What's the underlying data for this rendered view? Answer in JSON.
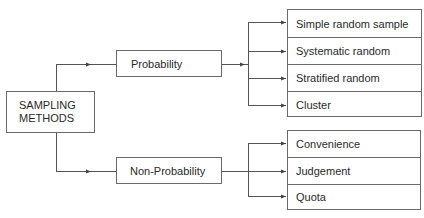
{
  "diagram": {
    "type": "tree",
    "root": {
      "label": "SAMPLING\nMETHODS"
    },
    "categories": [
      {
        "label": "Probability",
        "children": [
          {
            "label": "Simple random sample"
          },
          {
            "label": "Systematic random"
          },
          {
            "label": "Stratified random"
          },
          {
            "label": "Cluster"
          }
        ]
      },
      {
        "label": "Non-Probability",
        "children": [
          {
            "label": "Convenience"
          },
          {
            "label": "Judgement"
          },
          {
            "label": "Quota"
          }
        ]
      }
    ],
    "colors": {
      "line": "#555555",
      "border": "#6a6a6a",
      "text": "#2a2a2a",
      "background": "#ffffff"
    }
  }
}
